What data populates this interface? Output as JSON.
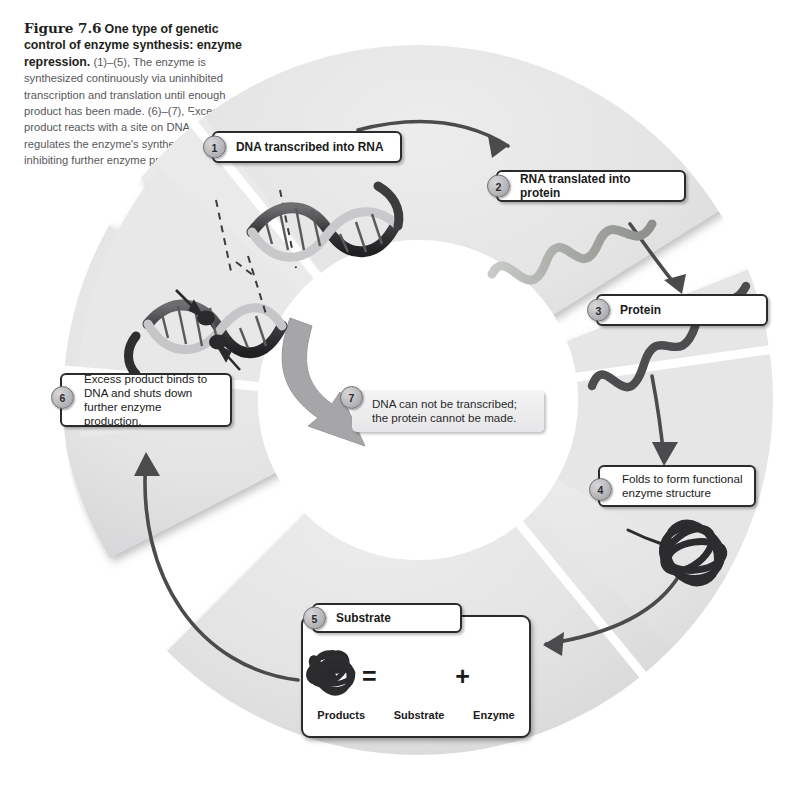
{
  "page": {
    "running_head": "",
    "background": "#ffffff"
  },
  "caption": {
    "figure_number": "Figure 7.6",
    "title": "One type of genetic control of enzyme synthesis: enzyme repression.",
    "body": "(1)–(5), The enzyme is synthesized continuously via uninhibited transcription and translation until enough product has been made. (6)–(7), Excess product reacts with a site on DNA that regulates the enzyme's synthesis, thereby inhibiting further enzyme production."
  },
  "diagram": {
    "type": "cycle",
    "ring_color": "#e3e3e4",
    "ring_shadow": "#cfcfd1",
    "arrow_color": "#4b4b4d",
    "gray_arrow_color": "#9d9da0",
    "steps": [
      {
        "number": "1",
        "label": "DNA transcribed into RNA",
        "bold": true,
        "style": "outlined",
        "illustration": "dna-double-helix"
      },
      {
        "number": "2",
        "label": "RNA translated into protein",
        "bold": true,
        "style": "outlined",
        "illustration": "rna-strand"
      },
      {
        "number": "3",
        "label": "Protein",
        "bold": true,
        "style": "outlined",
        "illustration": "protein-chain"
      },
      {
        "number": "4",
        "label": "Folds to form functional enzyme structure",
        "bold": false,
        "style": "outlined",
        "illustration": "folded-enzyme-knot"
      },
      {
        "number": "5",
        "label": "Substrate",
        "bold": true,
        "style": "outlined",
        "illustration": "reaction-equation"
      },
      {
        "number": "6",
        "label": "Excess product binds to DNA and shuts down further enzyme production.",
        "bold": false,
        "style": "outlined",
        "illustration": "dna-with-bound-product"
      },
      {
        "number": "7",
        "label": "DNA can not be transcribed; the protein cannot be made.",
        "bold": false,
        "style": "plain-gray",
        "illustration": "none"
      }
    ],
    "equation": {
      "terms": [
        "Products",
        "Substrate",
        "Enzyme"
      ],
      "operators": [
        "=",
        "+"
      ]
    }
  }
}
